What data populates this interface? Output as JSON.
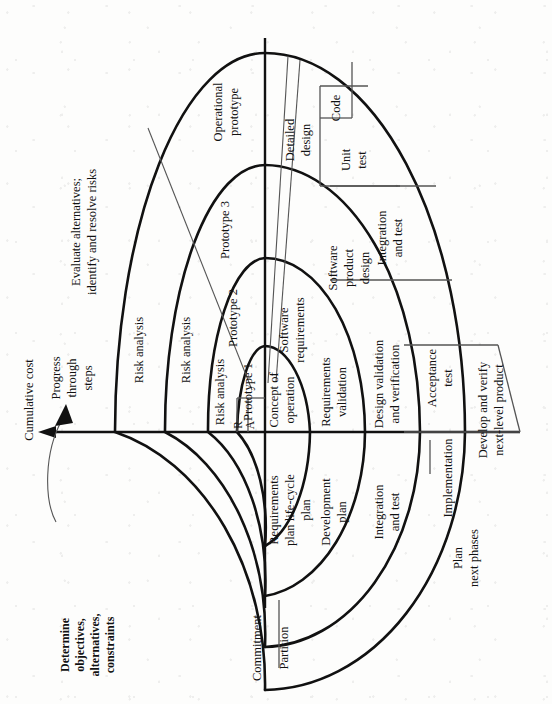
{
  "diagram": {
    "orientation": "rotated 90 degrees counter-clockwise",
    "axes": {
      "cumulative_cost": "Cumulative cost",
      "progress": "Progress\nthrough\nsteps",
      "progress_line1": "Progress",
      "progress_line2": "through",
      "progress_line3": "steps"
    },
    "quadrants": {
      "q1_line1": "Determine",
      "q1_line2": "objectives,",
      "q1_line3": "alternatives,",
      "q1_line4": "constraints",
      "q2_line1": "Evaluate alternatives;",
      "q2_line2": "identify and resolve risks",
      "q3_line1": "Develop and verify",
      "q3_line2": "next-level product",
      "q4_line1": "Plan",
      "q4_line2": "next phases"
    },
    "risk_labels": [
      "Risk analysis",
      "Risk analysis",
      "Risk analysis"
    ],
    "risk_abbrev_line1": "R",
    "risk_abbrev_line2": "A",
    "prototypes": {
      "p1": "Prototype 1",
      "p2": "Prototype 2",
      "p3": "Prototype 3",
      "operational_line1": "Operational",
      "operational_line2": "prototype"
    },
    "plan_sector": {
      "concept_line1": "Concept of",
      "concept_line2": "operation",
      "req_plan_line1": "Requirements",
      "req_plan_line2": "plan life-cycle",
      "req_plan_line3": "plan",
      "dev_plan_line1": "Development",
      "dev_plan_line2": "plan",
      "int_test_line1": "Integration",
      "int_test_line2": "and test"
    },
    "engineering_sector": {
      "sw_req_line1": "Software",
      "sw_req_line2": "requirements",
      "req_val_line1": "Requirements",
      "req_val_line2": "validation",
      "sw_design_line1": "Software",
      "sw_design_line2": "product",
      "sw_design_line3": "design",
      "design_val_line1": "Design validation",
      "design_val_line2": "and verification",
      "detailed_line1": "Detailed",
      "detailed_line2": "design",
      "code": "Code",
      "unit_test_line1": "Unit",
      "unit_test_line2": "test",
      "integration_line1": "Integration",
      "integration_line2": "and test",
      "acceptance_line1": "Acceptance",
      "acceptance_line2": "test",
      "implementation": "Implementation"
    },
    "baseline": {
      "commitment": "Commitment",
      "partition": "Partition"
    },
    "colors": {
      "ink": "#111111",
      "thin_rule": "#555555",
      "paper": "#fdfdfc"
    }
  }
}
